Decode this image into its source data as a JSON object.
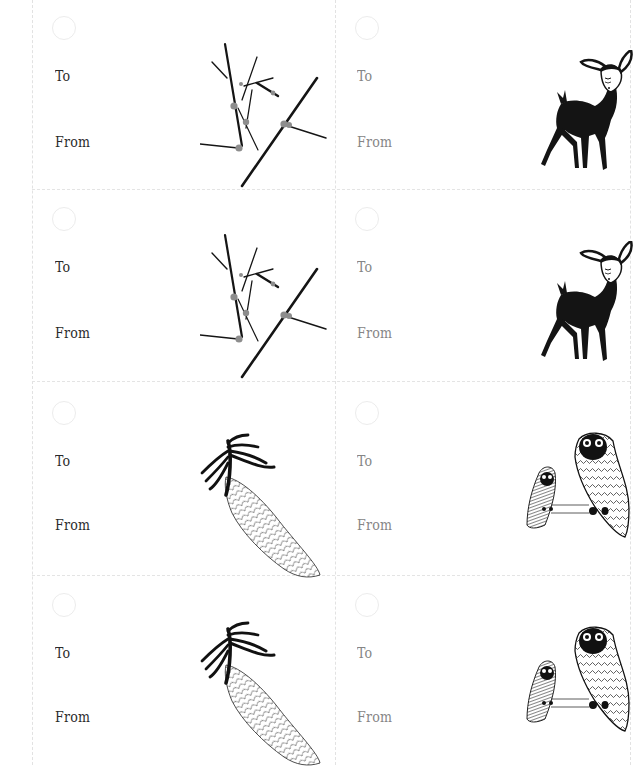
{
  "sheet": {
    "title": "Printable gift tags",
    "colors": {
      "background": "#ffffff",
      "label_dark": "#2a2a2a",
      "label_gray": "#858585",
      "ink": "#111111",
      "berry": "#8a8a8a",
      "cut_line": "#e2e2e2"
    }
  },
  "tags": [
    {
      "row": 1,
      "col": 1,
      "to_label": "To",
      "from_label": "From",
      "label_tone": "dark",
      "illustration": "branch-with-berries-icon"
    },
    {
      "row": 1,
      "col": 2,
      "to_label": "To",
      "from_label": "From",
      "label_tone": "gray",
      "illustration": "fawn-deer-icon"
    },
    {
      "row": 2,
      "col": 1,
      "to_label": "To",
      "from_label": "From",
      "label_tone": "dark",
      "illustration": "branch-with-berries-icon"
    },
    {
      "row": 2,
      "col": 2,
      "to_label": "To",
      "from_label": "From",
      "label_tone": "gray",
      "illustration": "fawn-deer-icon"
    },
    {
      "row": 3,
      "col": 1,
      "to_label": "To",
      "from_label": "From",
      "label_tone": "dark",
      "illustration": "pinecone-icon"
    },
    {
      "row": 3,
      "col": 2,
      "to_label": "To",
      "from_label": "From",
      "label_tone": "gray",
      "illustration": "owls-icon"
    },
    {
      "row": 4,
      "col": 1,
      "to_label": "To",
      "from_label": "From",
      "label_tone": "dark",
      "illustration": "pinecone-icon"
    },
    {
      "row": 4,
      "col": 2,
      "to_label": "To",
      "from_label": "From",
      "label_tone": "gray",
      "illustration": "owls-icon"
    }
  ]
}
